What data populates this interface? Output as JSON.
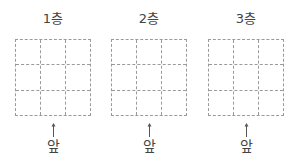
{
  "floors": [
    {
      "label": "1층",
      "rows": 3,
      "cols": 3,
      "front_label": "앞"
    },
    {
      "label": "2층",
      "rows": 3,
      "cols": 3,
      "front_label": "앞"
    },
    {
      "label": "3층",
      "rows": 3,
      "cols": 3,
      "front_label": "앞"
    }
  ],
  "icons": {
    "arrow": "arrow-up-icon"
  },
  "colors": {
    "grid_line": "#9a9a9a",
    "text": "#444444",
    "background": "#ffffff"
  }
}
